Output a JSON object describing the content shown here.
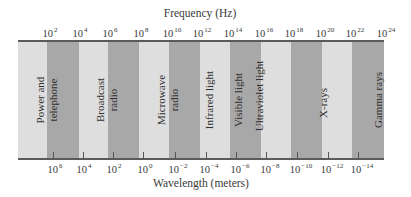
{
  "diagram": {
    "title_top": "Frequency (Hz)",
    "title_bottom": "Wavelength (meters)",
    "colors": {
      "light_band": "#dedede",
      "dark_band": "#a8a8a8",
      "border": "#5a5a5a",
      "text": "#333333"
    },
    "frequency_ticks": [
      {
        "base": "10",
        "exp": "2"
      },
      {
        "base": "10",
        "exp": "4"
      },
      {
        "base": "10",
        "exp": "6"
      },
      {
        "base": "10",
        "exp": "8"
      },
      {
        "base": "10",
        "exp": "10"
      },
      {
        "base": "10",
        "exp": "12"
      },
      {
        "base": "10",
        "exp": "14"
      },
      {
        "base": "10",
        "exp": "16"
      },
      {
        "base": "10",
        "exp": "18"
      },
      {
        "base": "10",
        "exp": "20"
      },
      {
        "base": "10",
        "exp": "22"
      },
      {
        "base": "10",
        "exp": "24"
      }
    ],
    "wavelength_ticks": [
      {
        "base": "10",
        "exp": "6"
      },
      {
        "base": "10",
        "exp": "4"
      },
      {
        "base": "10",
        "exp": "2"
      },
      {
        "base": "10",
        "exp": "0"
      },
      {
        "base": "10",
        "exp": "−2"
      },
      {
        "base": "10",
        "exp": "−4"
      },
      {
        "base": "10",
        "exp": "−6"
      },
      {
        "base": "10",
        "exp": "−8"
      },
      {
        "base": "10",
        "exp": "−10"
      },
      {
        "base": "10",
        "exp": "−12"
      },
      {
        "base": "10",
        "exp": "−14"
      }
    ],
    "regions": [
      {
        "line1": "Power and",
        "line2": "telephone"
      },
      {
        "line1": "Broadcast",
        "line2": "radio"
      },
      {
        "line1": "Microwave",
        "line2": "radio"
      },
      {
        "line1": "Infrared light",
        "line2": ""
      },
      {
        "line1": "Visible light",
        "line2": ""
      },
      {
        "line1": "Ultraviolet light",
        "line2": ""
      },
      {
        "line1": "X-rays",
        "line2": ""
      },
      {
        "line1": "Gamma rays",
        "line2": ""
      }
    ]
  }
}
